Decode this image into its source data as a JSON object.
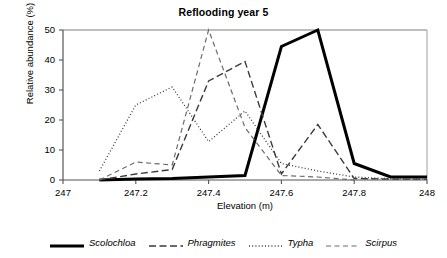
{
  "chart_data": {
    "type": "line",
    "title": "Reflooding year 5",
    "xlabel": "Elevation (m)",
    "ylabel": "Relative abundance (%)",
    "xlim": [
      247,
      248
    ],
    "ylim": [
      0,
      50
    ],
    "grid": false,
    "legend_position": "bottom",
    "xticks": [
      "247",
      "247.2",
      "247.4",
      "247.6",
      "247.8",
      "248"
    ],
    "xtick_values": [
      247,
      247.2,
      247.4,
      247.6,
      247.8,
      248
    ],
    "yticks": [
      "0",
      "10",
      "20",
      "30",
      "40",
      "50"
    ],
    "ytick_values": [
      0,
      10,
      20,
      30,
      40,
      50
    ],
    "x": [
      247.0,
      247.1,
      247.2,
      247.3,
      247.4,
      247.5,
      247.6,
      247.7,
      247.8,
      247.9,
      248.0
    ],
    "series": [
      {
        "name": "Scolochloa",
        "style": "solid-thick",
        "width": 3.0,
        "color": "#000000",
        "x": [
          247.1,
          247.2,
          247.3,
          247.4,
          247.5,
          247.6,
          247.7,
          247.8,
          247.9,
          248.0
        ],
        "values": [
          0,
          0.3,
          0.5,
          1.0,
          1.5,
          44.5,
          50,
          5.5,
          1.0,
          1.0
        ]
      },
      {
        "name": "Phragmites",
        "style": "dashed",
        "width": 1.4,
        "color": "#3a3a3a",
        "x": [
          247.1,
          247.2,
          247.3,
          247.4,
          247.5,
          247.6,
          247.7,
          247.8,
          247.9,
          248.0
        ],
        "values": [
          0,
          2.0,
          3.5,
          33.0,
          39.5,
          2.0,
          18.5,
          0.5,
          0.3,
          0.3
        ]
      },
      {
        "name": "Typha",
        "style": "dotted",
        "width": 1.3,
        "color": "#3a3a3a",
        "x": [
          247.1,
          247.2,
          247.3,
          247.4,
          247.5,
          247.6,
          247.7,
          247.8,
          247.9,
          248.0
        ],
        "values": [
          3.0,
          25.0,
          31.0,
          12.8,
          23.0,
          5.5,
          3.0,
          1.0,
          0.4,
          0.3
        ]
      },
      {
        "name": "Scirpus",
        "style": "long-dash",
        "width": 1.2,
        "color": "#6b6b6b",
        "x": [
          247.1,
          247.2,
          247.3,
          247.4,
          247.5,
          247.6,
          247.7,
          247.8
        ],
        "values": [
          0,
          6.0,
          5.0,
          50.0,
          17.5,
          1.5,
          1.0,
          0
        ]
      }
    ],
    "legend": [
      {
        "label": "Scolochloa",
        "style": "solid-thick"
      },
      {
        "label": "Phragmites",
        "style": "dashed"
      },
      {
        "label": "Typha",
        "style": "dotted"
      },
      {
        "label": "Scirpus",
        "style": "long-dash"
      }
    ]
  }
}
